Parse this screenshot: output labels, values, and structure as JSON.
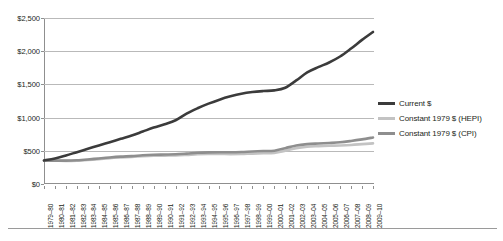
{
  "chart_data": {
    "type": "line",
    "title": "",
    "subtitle": "",
    "xlabel": "",
    "ylabel": "",
    "ylim": [
      0,
      2500
    ],
    "y_ticks": [
      0,
      500,
      1000,
      1500,
      2000,
      2500
    ],
    "y_tick_labels": [
      "$0",
      "$500",
      "$1,000",
      "$1,500",
      "$2,000",
      "$2,500"
    ],
    "grid": "horizontal",
    "legend_position": "right",
    "categories": [
      "1979–80",
      "1980–81",
      "1981–82",
      "1982–83",
      "1983–84",
      "1984–85",
      "1985–86",
      "1986–87",
      "1987–88",
      "1988–89",
      "1989–90",
      "1990–91",
      "1991–92",
      "1992–93",
      "1993–94",
      "1994–95",
      "1995–96",
      "1996–97",
      "1997–98",
      "1998–99",
      "1999–00",
      "2000–01",
      "2001–02",
      "2002–03",
      "2003–04",
      "2004–05",
      "2005–06",
      "2006–07",
      "2007–08",
      "2008–09",
      "2009–10"
    ],
    "series": [
      {
        "name": "Current $",
        "color": "#3b3b3b",
        "width": 2.6,
        "values": [
          355,
          385,
          430,
          480,
          530,
          580,
          630,
          680,
          730,
          790,
          850,
          900,
          960,
          1060,
          1140,
          1210,
          1270,
          1320,
          1360,
          1385,
          1400,
          1410,
          1450,
          1560,
          1680,
          1760,
          1830,
          1920,
          2040,
          2170,
          2290
        ]
      },
      {
        "name": "Constant 1979 $ (HEPI)",
        "color": "#c3c3c3",
        "width": 2.6,
        "values": [
          352,
          350,
          348,
          352,
          362,
          375,
          390,
          400,
          408,
          418,
          425,
          428,
          430,
          438,
          448,
          452,
          452,
          450,
          452,
          458,
          462,
          468,
          500,
          540,
          562,
          570,
          575,
          580,
          588,
          600,
          612
        ]
      },
      {
        "name": "Constant 1979 $ (CPI)",
        "color": "#8e8e8e",
        "width": 2.6,
        "values": [
          352,
          352,
          352,
          358,
          370,
          385,
          400,
          412,
          420,
          432,
          440,
          444,
          448,
          458,
          470,
          476,
          478,
          478,
          482,
          490,
          496,
          502,
          540,
          580,
          600,
          610,
          618,
          628,
          648,
          672,
          700
        ]
      }
    ]
  },
  "legend": {
    "entries": [
      {
        "label": "Current $"
      },
      {
        "label": "Constant 1979 $ (HEPI)"
      },
      {
        "label": "Constant 1979 $ (CPI)"
      }
    ]
  }
}
